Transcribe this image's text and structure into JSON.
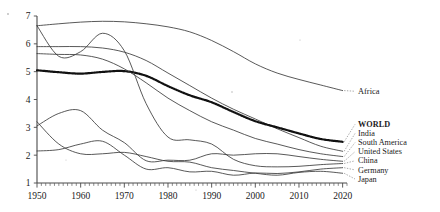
{
  "chart_data": {
    "type": "line",
    "title": "",
    "subtitle": "",
    "xlabel": "",
    "ylabel": "",
    "xlim": [
      1950,
      2021
    ],
    "ylim": [
      1,
      7
    ],
    "grid": false,
    "legend_position": "right-inline",
    "x_ticks": [
      1950,
      1960,
      1970,
      1980,
      1990,
      2000,
      2010,
      2020
    ],
    "x_tick_labels": [
      "1950",
      "1960",
      "1970",
      "1980",
      "1990",
      "2000",
      "2010",
      "2020"
    ],
    "x_minor_tick_step": 1,
    "y_ticks": [
      1,
      2,
      3,
      4,
      5,
      6,
      7
    ],
    "y_tick_labels": [
      "1",
      "2",
      "3",
      "4",
      "5",
      "6",
      "7"
    ],
    "x": [
      1950,
      1955,
      1960,
      1965,
      1970,
      1975,
      1980,
      1985,
      1990,
      1995,
      2000,
      2005,
      2010,
      2015,
      2020
    ],
    "series": [
      {
        "name": "Africa",
        "label": "Africa",
        "style": "solid",
        "emphasis": false,
        "label_x": 2022,
        "values": [
          6.65,
          6.72,
          6.78,
          6.81,
          6.79,
          6.72,
          6.61,
          6.43,
          6.12,
          5.72,
          5.28,
          4.95,
          4.72,
          4.52,
          4.32
        ]
      },
      {
        "name": "India",
        "label": "India",
        "style": "solid",
        "emphasis": false,
        "label_x": 2022,
        "values": [
          5.9,
          5.9,
          5.9,
          5.85,
          5.7,
          5.4,
          4.95,
          4.5,
          4.05,
          3.65,
          3.3,
          2.95,
          2.63,
          2.32,
          2.14
        ]
      },
      {
        "name": "WORLD",
        "label": "WORLD",
        "style": "dotted-thick",
        "emphasis": true,
        "label_x": 2022,
        "values": [
          5.05,
          4.98,
          4.93,
          4.99,
          5.02,
          4.85,
          4.48,
          4.15,
          3.9,
          3.55,
          3.22,
          3.0,
          2.78,
          2.58,
          2.48
        ]
      },
      {
        "name": "South America",
        "label": "South America",
        "style": "solid",
        "emphasis": false,
        "label_x": 2022,
        "values": [
          5.65,
          5.62,
          5.6,
          5.45,
          5.1,
          4.6,
          4.05,
          3.6,
          3.2,
          2.9,
          2.6,
          2.4,
          2.2,
          2.05,
          1.95
        ]
      },
      {
        "name": "China",
        "label": "China",
        "style": "solid",
        "emphasis": false,
        "label_x": 2022,
        "values": [
          6.65,
          5.55,
          5.72,
          6.38,
          5.75,
          3.85,
          2.65,
          2.55,
          2.4,
          1.85,
          1.62,
          1.58,
          1.6,
          1.66,
          1.7
        ]
      },
      {
        "name": "United States",
        "label": "United States",
        "style": "solid",
        "emphasis": false,
        "label_x": 2022,
        "values": [
          3.05,
          3.5,
          3.6,
          2.9,
          2.45,
          1.8,
          1.82,
          1.82,
          2.05,
          2.0,
          2.05,
          2.05,
          1.95,
          1.85,
          1.78
        ]
      },
      {
        "name": "Germany",
        "label": "Germany",
        "style": "solid",
        "emphasis": false,
        "label_x": 2022,
        "values": [
          2.15,
          2.2,
          2.4,
          2.5,
          2.0,
          1.5,
          1.55,
          1.4,
          1.42,
          1.28,
          1.36,
          1.34,
          1.4,
          1.5,
          1.55
        ]
      },
      {
        "name": "Japan",
        "label": "Japan",
        "style": "solid",
        "emphasis": false,
        "label_x": 2022,
        "values": [
          3.2,
          2.4,
          2.05,
          2.05,
          2.1,
          1.95,
          1.78,
          1.75,
          1.55,
          1.45,
          1.35,
          1.28,
          1.38,
          1.42,
          1.35
        ]
      }
    ],
    "annotations": [
      {
        "text": "Africa",
        "series": "Africa"
      }
    ],
    "legend_entries": [
      {
        "label": "WORLD",
        "bold": true
      },
      {
        "label": "India",
        "bold": false
      },
      {
        "label": "South America",
        "bold": false
      },
      {
        "label": "United States",
        "bold": false
      },
      {
        "label": "China",
        "bold": false
      },
      {
        "label": "Germany",
        "bold": false
      },
      {
        "label": "Japan",
        "bold": false
      }
    ],
    "colors": {
      "line": "#3b3b3b",
      "world_line": "#111111",
      "axis": "#4a4a4a",
      "text": "#1a1a1a",
      "background": "#ffffff"
    }
  }
}
